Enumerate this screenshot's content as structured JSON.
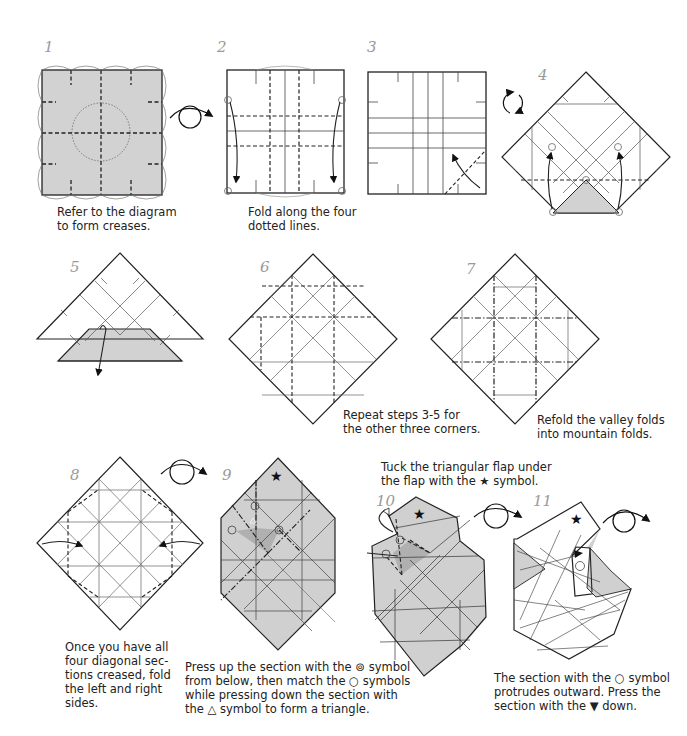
{
  "page": {
    "type": "origami-instructions",
    "accent_fill": "#cfcfcf",
    "line_color": "#222222"
  },
  "steps": [
    {
      "number": "1",
      "caption_lines": [
        "Refer to the diagram",
        "to form creases."
      ]
    },
    {
      "number": "2",
      "caption_lines": [
        "Fold along the four",
        "dotted lines."
      ]
    },
    {
      "number": "3",
      "caption_lines": []
    },
    {
      "number": "4",
      "caption_lines": []
    },
    {
      "number": "5",
      "caption_lines": []
    },
    {
      "number": "6",
      "caption_lines": [
        "Repeat steps 3-5 for",
        "the other three corners."
      ]
    },
    {
      "number": "7",
      "caption_lines": [
        "Refold the valley folds",
        "into mountain folds."
      ]
    },
    {
      "number": "8",
      "caption_lines": [
        "Once you have all",
        "four diagonal sec-",
        "tions creased, fold",
        "the left and right",
        "sides."
      ]
    },
    {
      "number": "9",
      "caption_lines": [
        "Press up the section with the ⊚ symbol",
        "from below, then match the ○ symbols",
        "while pressing down the section with",
        "the △ symbol to form a triangle."
      ]
    },
    {
      "number": "10",
      "caption_lines": [
        "Tuck the triangular flap under",
        "the flap with the ★ symbol."
      ]
    },
    {
      "number": "11",
      "caption_lines": [
        "The section with the ○ symbol",
        "protrudes outward. Press the",
        "section with the ▼ down."
      ]
    }
  ],
  "symbols": {
    "star": "★"
  }
}
